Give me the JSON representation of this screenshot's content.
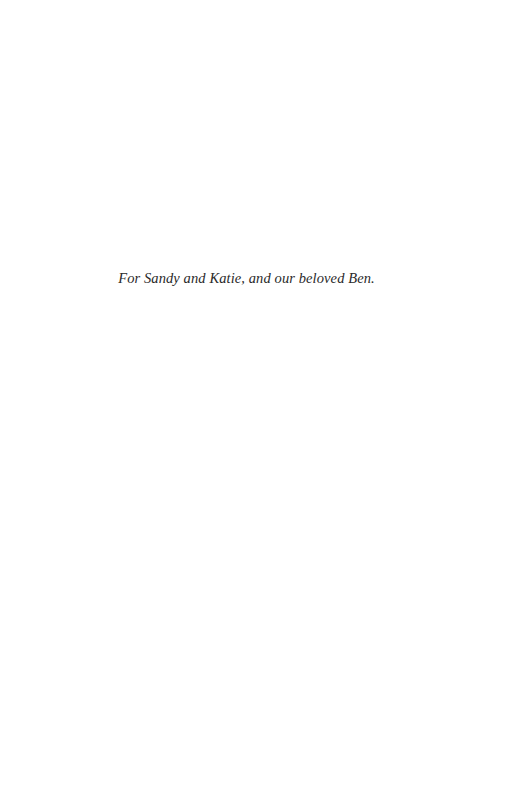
{
  "page": {
    "type": "dedication",
    "dedication_text": "For Sandy and Katie, and our beloved Ben."
  },
  "colors": {
    "background": "#ffffff",
    "text": "#2a2a2a"
  }
}
